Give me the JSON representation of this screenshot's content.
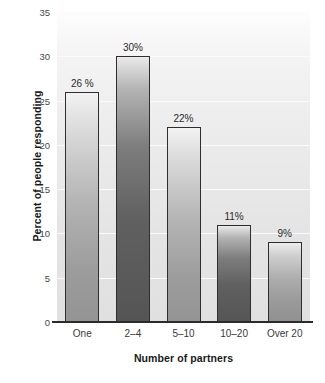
{
  "chart_data": {
    "type": "bar",
    "title": "",
    "xlabel": "Number of partners",
    "ylabel": "Percent of people responding",
    "categories": [
      "One",
      "2–4",
      "5–10",
      "10–20",
      "Over 20"
    ],
    "values": [
      26,
      30,
      22,
      11,
      9
    ],
    "data_labels": [
      "26 %",
      "30%",
      "22%",
      "11%",
      "9%"
    ],
    "bar_shades": [
      "light",
      "dark",
      "light",
      "dark",
      "mid"
    ],
    "ylim": [
      0,
      35
    ],
    "yticks": [
      0,
      5,
      10,
      15,
      20,
      25,
      30,
      35
    ],
    "ytick_labels": [
      "0",
      "5",
      "10",
      "15",
      "20",
      "25",
      "30",
      "35"
    ],
    "grid": true,
    "grid_axis": "y",
    "legend": false,
    "legend_position": "none",
    "background_color": "#e8e8e8",
    "gridline_color": "#fbfbfb",
    "axis_color": "#2b2b2b",
    "bar_edge_color": "#2e2e2e",
    "label_color": "#2a2a2a"
  }
}
